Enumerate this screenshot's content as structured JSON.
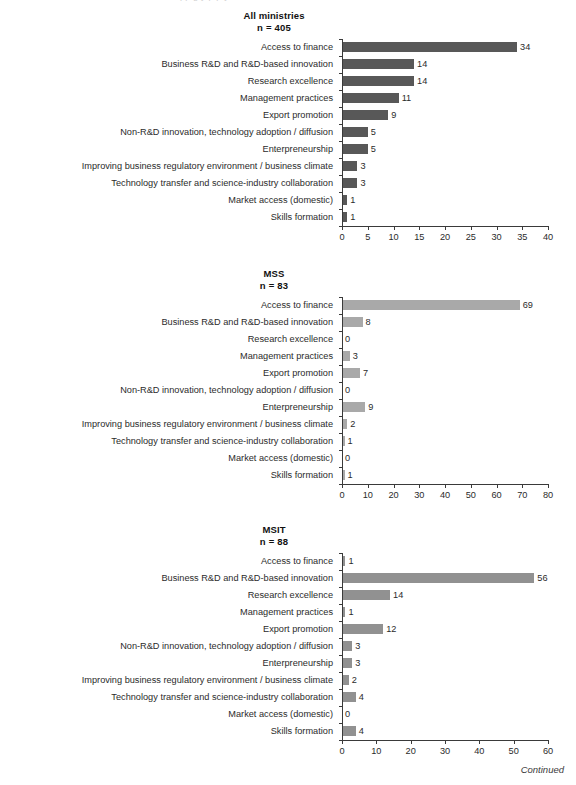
{
  "page": {
    "cropped_header_fragment": "pp  g    y p p             y",
    "continued_note": "Continued"
  },
  "categories": [
    "Access to finance",
    "Business R&D and R&D-based innovation",
    "Research excellence",
    "Management practices",
    "Export promotion",
    "Non-R&D innovation, technology adoption / diffusion",
    "Enterpreneurship",
    "Improving business regulatory environment / business climate",
    "Technology transfer and science-industry collaboration",
    "Market access (domestic)",
    "Skills formation"
  ],
  "colors": {
    "bar_all_ministries": "#585858",
    "bar_mss": "#a9a9a9",
    "bar_msit": "#919191",
    "axis": "#3a3a3a",
    "text": "#2b2b2b"
  },
  "chart_data": [
    {
      "type": "bar",
      "orientation": "horizontal",
      "title": "All ministries",
      "subtitle": "n = 405",
      "n": 405,
      "xlabel": "",
      "ylabel": "",
      "xlim": [
        0,
        40
      ],
      "xticks": [
        0,
        5,
        10,
        15,
        20,
        25,
        30,
        35,
        40
      ],
      "grid": false,
      "legend": "none",
      "bar_color": "#585858",
      "categories": [
        "Access to finance",
        "Business R&D and R&D-based innovation",
        "Research excellence",
        "Management practices",
        "Export promotion",
        "Non-R&D innovation, technology adoption / diffusion",
        "Enterpreneurship",
        "Improving business regulatory environment / business climate",
        "Technology transfer and science-industry collaboration",
        "Market access (domestic)",
        "Skills formation"
      ],
      "values": [
        34,
        14,
        14,
        11,
        9,
        5,
        5,
        3,
        3,
        1,
        1
      ],
      "value_labels": [
        "34",
        "14",
        "14",
        "11",
        "9",
        "5",
        "5",
        "3",
        "3",
        "1",
        "1"
      ]
    },
    {
      "type": "bar",
      "orientation": "horizontal",
      "title": "MSS",
      "subtitle": "n = 83",
      "n": 83,
      "xlabel": "",
      "ylabel": "",
      "xlim": [
        0,
        80
      ],
      "xticks": [
        0,
        10,
        20,
        30,
        40,
        50,
        60,
        70,
        80
      ],
      "grid": false,
      "legend": "none",
      "bar_color": "#a9a9a9",
      "categories": [
        "Access to finance",
        "Business R&D and R&D-based innovation",
        "Research excellence",
        "Management practices",
        "Export promotion",
        "Non-R&D innovation, technology adoption / diffusion",
        "Enterpreneurship",
        "Improving business regulatory environment / business climate",
        "Technology transfer and science-industry collaboration",
        "Market access (domestic)",
        "Skills formation"
      ],
      "values": [
        69,
        8,
        0,
        3,
        7,
        0,
        9,
        2,
        1,
        0,
        1
      ],
      "value_labels": [
        "69",
        "8",
        "0",
        "3",
        "7",
        "0",
        "9",
        "2",
        "1",
        "0",
        "1"
      ]
    },
    {
      "type": "bar",
      "orientation": "horizontal",
      "title": "MSIT",
      "subtitle": "n = 88",
      "n": 88,
      "xlabel": "",
      "ylabel": "",
      "xlim": [
        0,
        60
      ],
      "xticks": [
        0,
        10,
        20,
        30,
        40,
        50,
        60
      ],
      "grid": false,
      "legend": "none",
      "bar_color": "#919191",
      "categories": [
        "Access to finance",
        "Business R&D and R&D-based innovation",
        "Research excellence",
        "Management practices",
        "Export promotion",
        "Non-R&D innovation, technology adoption / diffusion",
        "Enterpreneurship",
        "Improving business regulatory environment / business climate",
        "Technology transfer and science-industry collaboration",
        "Market access (domestic)",
        "Skills formation"
      ],
      "values": [
        1,
        56,
        14,
        1,
        12,
        3,
        3,
        2,
        4,
        0,
        4
      ],
      "value_labels": [
        "1",
        "56",
        "14",
        "1",
        "12",
        "3",
        "3",
        "2",
        "4",
        "0",
        "4"
      ]
    }
  ]
}
